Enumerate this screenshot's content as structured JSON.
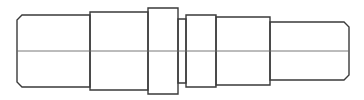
{
  "drawing": {
    "title": "Stepped shaft side view",
    "stroke_color": "#3a3a3a",
    "centerline_color": "#6a6a6a",
    "background": "#ffffff",
    "centerline": {
      "x1": 17,
      "x2": 349,
      "y": 51
    },
    "sections": [
      {
        "name": "left-journal",
        "x1": 17,
        "x2": 90,
        "top": 15,
        "bottom": 87,
        "chamfer_left": 5
      },
      {
        "name": "shoulder-1",
        "x1": 90,
        "x2": 148,
        "top": 12,
        "bottom": 90
      },
      {
        "name": "collar-1",
        "x1": 148,
        "x2": 178,
        "top": 8,
        "bottom": 94
      },
      {
        "name": "groove",
        "x1": 178,
        "x2": 186,
        "top": 19,
        "bottom": 83
      },
      {
        "name": "collar-2",
        "x1": 186,
        "x2": 216,
        "top": 15,
        "bottom": 87
      },
      {
        "name": "shoulder-2",
        "x1": 216,
        "x2": 270,
        "top": 17,
        "bottom": 85
      },
      {
        "name": "right-journal",
        "x1": 270,
        "x2": 349,
        "top": 22,
        "bottom": 80,
        "chamfer_right": 5
      }
    ]
  }
}
